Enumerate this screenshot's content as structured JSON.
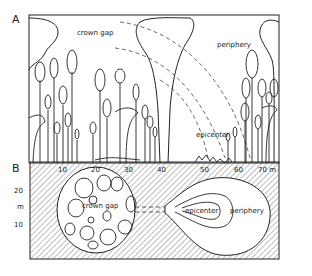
{
  "panel_a": {
    "letter": "A",
    "labels": {
      "crown_gap": "crown gap",
      "periphery": "periphery",
      "epicenter": "epicenter"
    }
  },
  "panel_b": {
    "letter": "B",
    "x_ticks": [
      "10",
      "20",
      "30",
      "40",
      "50",
      "60",
      "70 m"
    ],
    "y_ticks": [
      "20",
      "m",
      "10"
    ],
    "labels": {
      "crown_gap": "crown gap",
      "epicenter": "epicenter",
      "periphery": "periphery"
    }
  },
  "colors": {
    "line": "#222222",
    "background": "#ffffff"
  }
}
